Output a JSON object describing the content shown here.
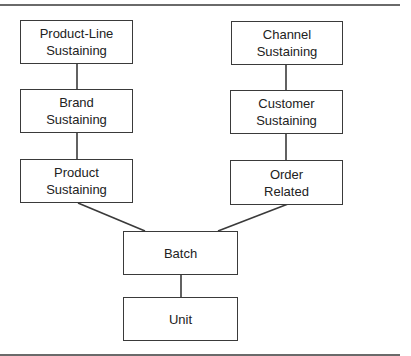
{
  "diagram": {
    "type": "hierarchy",
    "nodes": {
      "product_line": {
        "line1": "Product-Line",
        "line2": "Sustaining"
      },
      "brand": {
        "line1": "Brand",
        "line2": "Sustaining"
      },
      "product": {
        "line1": "Product",
        "line2": "Sustaining"
      },
      "channel": {
        "line1": "Channel",
        "line2": "Sustaining"
      },
      "customer": {
        "line1": "Customer",
        "line2": "Sustaining"
      },
      "order": {
        "line1": "Order",
        "line2": "Related"
      },
      "batch": {
        "label": "Batch"
      },
      "unit": {
        "label": "Unit"
      }
    },
    "edges": [
      [
        "Product-Line Sustaining",
        "Brand Sustaining"
      ],
      [
        "Brand Sustaining",
        "Product Sustaining"
      ],
      [
        "Product Sustaining",
        "Batch"
      ],
      [
        "Channel Sustaining",
        "Customer Sustaining"
      ],
      [
        "Customer Sustaining",
        "Order Related"
      ],
      [
        "Order Related",
        "Batch"
      ],
      [
        "Batch",
        "Unit"
      ]
    ],
    "colors": {
      "line": "#3a3a3a",
      "rule": "#6a6a6a",
      "text": "#222222",
      "background": "#ffffff"
    }
  }
}
